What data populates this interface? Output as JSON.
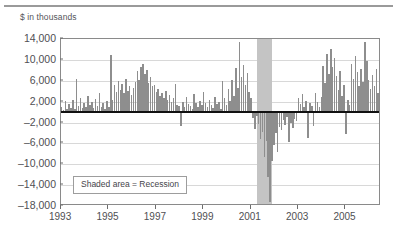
{
  "unit_label": "$ in thousands",
  "legend": {
    "text": "Shaded area = Recession"
  },
  "chart_data": {
    "type": "bar",
    "title": "",
    "subtitle": "",
    "xlabel": "",
    "ylabel": "$ in thousands",
    "ylim": [
      -18000,
      14000
    ],
    "xlim": [
      1993.0,
      2006.5
    ],
    "grid": true,
    "legend_position": "inside-lower-left",
    "legend_entries": [
      "Shaded area = Recession"
    ],
    "annotations": [
      {
        "text": "Shaded area = Recession",
        "x": 1994.2,
        "y": -13500
      }
    ],
    "y_ticks": [
      14000,
      10000,
      6000,
      2000,
      -2000,
      -6000,
      -10000,
      -14000,
      -18000
    ],
    "y_tick_labels": [
      "14,000",
      "10,000",
      "6,000",
      "2,000",
      "-2,000",
      "-6,000",
      "-10,000",
      "-14,000",
      "-18,000"
    ],
    "x_ticks": [
      1993,
      1995,
      1997,
      1999,
      2001,
      2003,
      2005
    ],
    "x_tick_labels": [
      "1993",
      "1995",
      "1997",
      "1999",
      "2001",
      "2003",
      "2005"
    ],
    "shaded_regions": [
      {
        "label": "Recession",
        "x_start": 2001.25,
        "x_end": 2001.92,
        "color": "#c4c4c4"
      }
    ],
    "bar_color": "#8e8e8e",
    "zero_line_color": "#111111",
    "series": [
      {
        "name": "Net flows",
        "x": [
          1993.02,
          1993.1,
          1993.18,
          1993.26,
          1993.34,
          1993.42,
          1993.5,
          1993.58,
          1993.66,
          1993.74,
          1993.82,
          1993.9,
          1993.98,
          1994.06,
          1994.14,
          1994.22,
          1994.3,
          1994.38,
          1994.46,
          1994.54,
          1994.62,
          1994.7,
          1994.78,
          1994.86,
          1994.94,
          1995.02,
          1995.1,
          1995.18,
          1995.26,
          1995.34,
          1995.42,
          1995.5,
          1995.58,
          1995.66,
          1995.74,
          1995.82,
          1995.9,
          1995.98,
          1996.06,
          1996.14,
          1996.22,
          1996.3,
          1996.38,
          1996.46,
          1996.54,
          1996.62,
          1996.7,
          1996.78,
          1996.86,
          1996.94,
          1997.02,
          1997.1,
          1997.18,
          1997.26,
          1997.34,
          1997.42,
          1997.5,
          1997.58,
          1997.66,
          1997.74,
          1997.82,
          1997.9,
          1997.98,
          1998.06,
          1998.14,
          1998.22,
          1998.3,
          1998.38,
          1998.46,
          1998.54,
          1998.62,
          1998.7,
          1998.78,
          1998.86,
          1998.94,
          1999.02,
          1999.1,
          1999.18,
          1999.26,
          1999.34,
          1999.42,
          1999.5,
          1999.58,
          1999.66,
          1999.74,
          1999.82,
          1999.9,
          1999.98,
          2000.06,
          2000.14,
          2000.22,
          2000.3,
          2000.38,
          2000.46,
          2000.54,
          2000.62,
          2000.7,
          2000.78,
          2000.86,
          2000.94,
          2001.02,
          2001.1,
          2001.18,
          2001.26,
          2001.34,
          2001.42,
          2001.5,
          2001.58,
          2001.66,
          2001.74,
          2001.82,
          2001.9,
          2001.98,
          2002.06,
          2002.14,
          2002.22,
          2002.3,
          2002.38,
          2002.46,
          2002.54,
          2002.62,
          2002.7,
          2002.78,
          2002.86,
          2002.94,
          2003.02,
          2003.1,
          2003.18,
          2003.26,
          2003.34,
          2003.42,
          2003.5,
          2003.58,
          2003.66,
          2003.74,
          2003.82,
          2003.9,
          2003.98,
          2004.06,
          2004.14,
          2004.22,
          2004.3,
          2004.38,
          2004.46,
          2004.54,
          2004.62,
          2004.7,
          2004.78,
          2004.86,
          2004.94,
          2005.02,
          2005.1,
          2005.18,
          2005.26,
          2005.34,
          2005.42,
          2005.5,
          2005.58,
          2005.66,
          2005.74,
          2005.82,
          2005.9,
          2005.98,
          2006.06,
          2006.14,
          2006.22,
          2006.3,
          2006.38
        ],
        "values": [
          900,
          400,
          2100,
          600,
          1500,
          700,
          2400,
          500,
          6300,
          1200,
          2600,
          800,
          1700,
          900,
          3000,
          1300,
          2000,
          700,
          2500,
          1100,
          3700,
          900,
          1800,
          600,
          2200,
          1000,
          10900,
          2400,
          5200,
          3800,
          6000,
          4200,
          5400,
          3600,
          6400,
          4000,
          5000,
          3200,
          4600,
          5800,
          7900,
          6100,
          8700,
          9200,
          7300,
          8100,
          5600,
          6700,
          4900,
          5100,
          3900,
          4500,
          3000,
          3600,
          2700,
          4100,
          2300,
          3300,
          1900,
          2600,
          5300,
          1400,
          1200,
          -2600,
          2000,
          900,
          2800,
          1500,
          1100,
          600,
          3400,
          1800,
          900,
          2200,
          1300,
          3800,
          1700,
          1000,
          2400,
          1400,
          800,
          2900,
          1500,
          1900,
          600,
          5900,
          2700,
          1300,
          4400,
          2100,
          6200,
          3100,
          8400,
          4700,
          13500,
          6800,
          9100,
          5200,
          7400,
          3900,
          2600,
          -1200,
          -3300,
          -800,
          -2200,
          -5100,
          -3900,
          -8700,
          -5600,
          -12400,
          -17200,
          -9300,
          -6400,
          -4100,
          -7600,
          -2800,
          -3500,
          -1600,
          -2400,
          -900,
          -5800,
          -2100,
          -3000,
          -1300,
          -1800,
          2600,
          1500,
          3400,
          900,
          2200,
          -4900,
          1700,
          1100,
          -2600,
          3600,
          2000,
          900,
          2800,
          8900,
          5600,
          11200,
          7300,
          12100,
          8600,
          10400,
          6900,
          4300,
          7800,
          3100,
          5200,
          -4200,
          2400,
          1300,
          9200,
          6400,
          10800,
          7600,
          4900,
          8300,
          5700,
          13400,
          9700,
          6200,
          4400,
          7100,
          5000,
          8200,
          3600
        ]
      }
    ]
  }
}
